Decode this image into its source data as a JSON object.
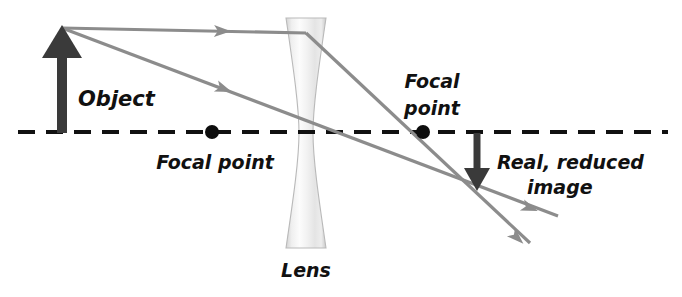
{
  "diagram": {
    "background_color": "#ffffff",
    "labels": {
      "object": "Object",
      "lens": "Lens",
      "focal_point_left": "Focal point",
      "focal_point_right_line1": "Focal",
      "focal_point_right_line2": "point",
      "image_line1": "Real, reduced",
      "image_line2": "image"
    },
    "colors": {
      "ray": "#8c8c8c",
      "axis": "#111111",
      "arrow": "#3a3a3a",
      "focal_dot": "#0d0d0d",
      "lens_fill_light": "#fbfbfb",
      "lens_fill_shade": "#d8d8d8",
      "text": "#111111"
    },
    "optical_axis": {
      "y": 132,
      "x_start": 18,
      "x_end": 668,
      "style": "dashed"
    },
    "lens": {
      "type": "biconcave",
      "center_x": 306,
      "top_y": 18,
      "bottom_y": 248,
      "edge_half_width": 20,
      "waist_half_width": 7
    },
    "object": {
      "base_x": 62,
      "base_y": 132,
      "tip_y": 28,
      "direction": "up",
      "label_x": 78,
      "label_y": 99
    },
    "image": {
      "base_x": 477,
      "base_y": 133,
      "tip_y": 189,
      "direction": "down",
      "label_x": 497,
      "label_y": 163
    },
    "focal_points": [
      {
        "id": "left",
        "x": 212,
        "y": 132,
        "label_x": 148,
        "label_y": 162
      },
      {
        "id": "right",
        "x": 423,
        "y": 132,
        "label_x": 395,
        "label_y": 83
      }
    ],
    "rays": [
      {
        "id": "parallel-ray",
        "description": "Parallel ray from object tip to lens, refracted toward image point",
        "points": [
          [
            62,
            28
          ],
          [
            306,
            33
          ],
          [
            477,
            189
          ]
        ],
        "arrowheads": [
          {
            "x": 214,
            "y": 31,
            "angle": 1.2
          },
          {
            "x": 530,
            "y": 243,
            "angle": 42.4
          }
        ],
        "extends_to": [
          530,
          243
        ]
      },
      {
        "id": "center-ray",
        "description": "Ray from object tip through lens center continuing to image point",
        "points": [
          [
            62,
            28
          ],
          [
            477,
            189
          ],
          [
            558,
            216
          ]
        ],
        "arrowheads": [
          {
            "x": 215,
            "y": 87,
            "angle": 21.2
          },
          {
            "x": 528,
            "y": 208,
            "angle": 18.5
          }
        ],
        "extends_to": [
          558,
          216
        ]
      }
    ]
  }
}
